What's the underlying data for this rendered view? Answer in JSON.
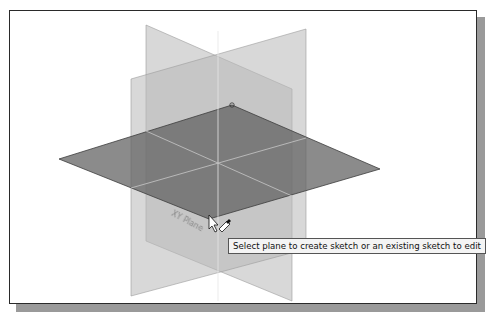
{
  "viewport": {
    "background": "#ffffff",
    "border_color": "#2a2a2a",
    "shadow_color": "#9a9a9a"
  },
  "planes": {
    "front_plane": {
      "label": "Front Plane",
      "color": "#bdbdbd"
    },
    "right_plane": {
      "label": "Right Plane",
      "color": "#c4c4c4"
    },
    "top_plane": {
      "label": "XY Plane",
      "color": "#6f6f6f"
    }
  },
  "tooltip": {
    "text": "Select plane to create sketch or an existing sketch to edit"
  },
  "cursor": {
    "icon": "arrow-pointer-with-sketch-pencil-icon"
  }
}
